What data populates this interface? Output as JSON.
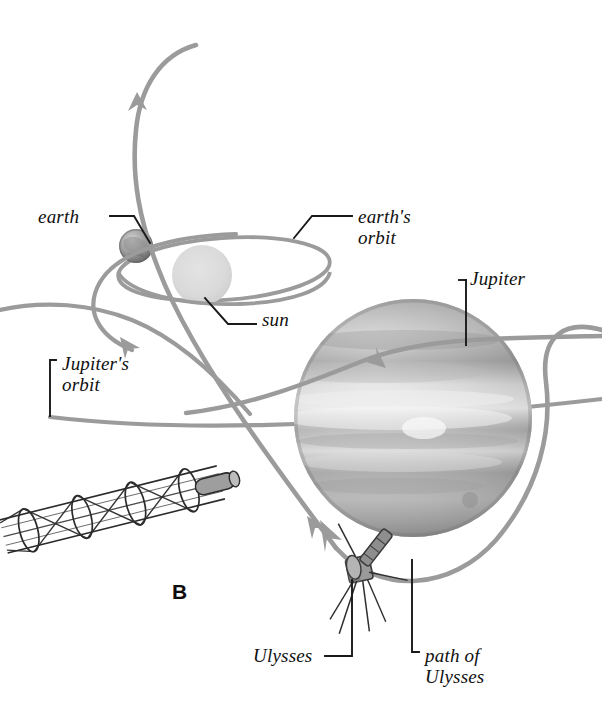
{
  "figure": {
    "panel_letter": "B",
    "background_color": "#ffffff",
    "width": 602,
    "height": 723
  },
  "labels": {
    "earth": "earth",
    "earths_orbit": "earth's\norbit",
    "jupiter": "Jupiter",
    "sun": "sun",
    "jupiters_orbit": "Jupiter's\norbit",
    "ulysses": "Ulysses",
    "path_of_ulysses": "path of\nUlysses"
  },
  "colors": {
    "trajectory": "#9b9b9b",
    "orbit": "#9b9b9b",
    "leader_line": "#1a1a1a",
    "sun_fill": "#d9d9d9",
    "earth_dark": "#6e6e6e",
    "earth_light": "#c9c9c9",
    "jupiter_dark": "#8c8c8c",
    "jupiter_light": "#e2e2e2",
    "spacecraft": "#4a4a4a",
    "truss": "#2b2b2b",
    "text": "#101010"
  },
  "objects": {
    "sun": {
      "name": "sun",
      "cx": 202,
      "cy": 275,
      "r": 30
    },
    "earth": {
      "name": "earth",
      "cx": 136,
      "cy": 246,
      "r": 17
    },
    "jupiter": {
      "name": "Jupiter",
      "cx": 413,
      "cy": 418,
      "r": 119
    },
    "spacecraft": {
      "name": "Ulysses",
      "cx": 360,
      "cy": 568
    },
    "truss": {
      "name": "deployable truss boom",
      "cx": 120,
      "cy": 510
    }
  },
  "paths": {
    "earths_orbit": {
      "name": "earth's orbit",
      "type": "ellipse-3d",
      "cx": 224,
      "cy": 269,
      "rx": 106,
      "ry": 32
    },
    "jupiters_orbit": {
      "name": "Jupiter's orbit",
      "type": "shallow-arc",
      "x_start": 50,
      "y_start": 417,
      "x_end": 602,
      "y_end": 404
    },
    "ulysses_path": {
      "name": "path of Ulysses",
      "type": "trajectory",
      "arrow_count": 4
    }
  }
}
